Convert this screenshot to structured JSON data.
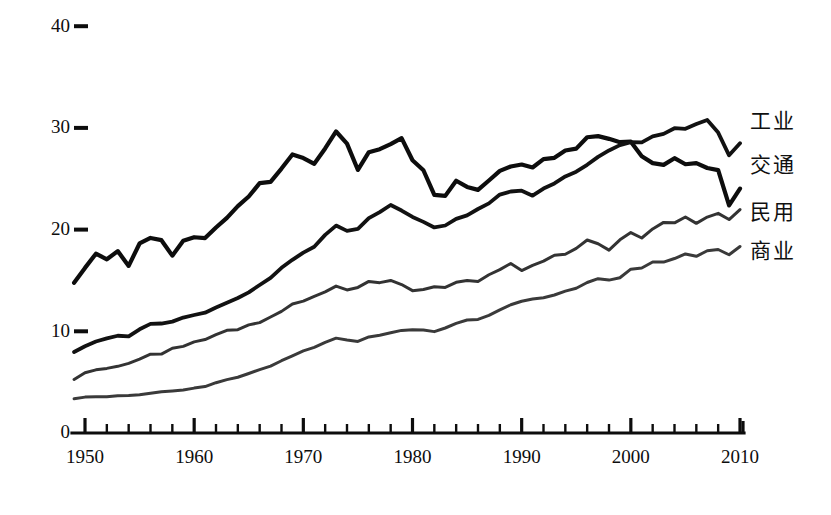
{
  "chart_data": {
    "type": "line",
    "title": "",
    "subtitle": "",
    "xlabel": "",
    "ylabel": "",
    "xlim": [
      1949,
      2010
    ],
    "ylim": [
      0,
      40
    ],
    "grid": false,
    "legend_position": "right-inline",
    "y_ticks": [
      0,
      10,
      20,
      30,
      40
    ],
    "y_tick_labels": [
      "0",
      "10",
      "20",
      "30",
      "40"
    ],
    "x_ticks": [
      1950,
      1960,
      1970,
      1980,
      1990,
      2000,
      2010
    ],
    "x_tick_labels": [
      "1950",
      "1960",
      "1970",
      "1980",
      "1990",
      "2000",
      "2010"
    ],
    "x_minor_tick_step": 2,
    "x": [
      1949,
      1950,
      1951,
      1952,
      1953,
      1954,
      1955,
      1956,
      1957,
      1958,
      1959,
      1960,
      1961,
      1962,
      1963,
      1964,
      1965,
      1966,
      1967,
      1968,
      1969,
      1970,
      1971,
      1972,
      1973,
      1974,
      1975,
      1976,
      1977,
      1978,
      1979,
      1980,
      1981,
      1982,
      1983,
      1984,
      1985,
      1986,
      1987,
      1988,
      1989,
      1990,
      1991,
      1992,
      1993,
      1994,
      1995,
      1996,
      1997,
      1998,
      1999,
      2000,
      2001,
      2002,
      2003,
      2004,
      2005,
      2006,
      2007,
      2008,
      2009,
      2010
    ],
    "series": [
      {
        "name": "工业",
        "color": "#0d0d0d",
        "width": 4.2,
        "label_x": 2011,
        "label_y": 30.5,
        "values": [
          14.8,
          16.2,
          17.6,
          17.1,
          17.9,
          16.4,
          18.6,
          19.2,
          19.0,
          17.4,
          18.9,
          19.3,
          19.2,
          20.2,
          21.2,
          22.3,
          23.3,
          24.6,
          24.7,
          26.0,
          27.4,
          27.0,
          26.5,
          28.0,
          29.6,
          28.5,
          25.9,
          27.6,
          27.9,
          28.4,
          29.0,
          26.8,
          25.8,
          23.4,
          23.3,
          24.8,
          24.2,
          23.9,
          24.8,
          25.8,
          26.2,
          26.4,
          26.1,
          26.9,
          27.1,
          27.8,
          28.0,
          29.1,
          29.2,
          28.9,
          28.6,
          28.6,
          27.2,
          26.5,
          26.4,
          27.0,
          26.4,
          26.5,
          26.1,
          25.8,
          22.4,
          24.0
        ]
      },
      {
        "name": "交通",
        "color": "#121212",
        "width": 3.8,
        "label_x": 2011,
        "label_y": 26.2,
        "values": [
          8.0,
          8.5,
          9.0,
          9.3,
          9.6,
          9.5,
          10.2,
          10.7,
          10.8,
          10.9,
          11.4,
          11.6,
          11.8,
          12.3,
          12.8,
          13.3,
          13.8,
          14.6,
          15.3,
          16.2,
          17.0,
          17.7,
          18.3,
          19.5,
          20.4,
          19.9,
          20.1,
          21.1,
          21.7,
          22.4,
          21.9,
          21.2,
          20.8,
          20.2,
          20.4,
          21.1,
          21.4,
          22.0,
          22.6,
          23.4,
          23.7,
          23.8,
          23.3,
          24.0,
          24.5,
          25.2,
          25.7,
          26.4,
          27.1,
          27.8,
          28.3,
          28.6,
          28.6,
          29.2,
          29.4,
          30.0,
          29.9,
          30.4,
          30.8,
          29.5,
          27.3,
          28.5
        ]
      },
      {
        "name": "民用",
        "color": "#333333",
        "width": 3.0,
        "label_x": 2011,
        "label_y": 21.6,
        "values": [
          5.3,
          5.9,
          6.2,
          6.4,
          6.6,
          6.8,
          7.3,
          7.7,
          7.8,
          8.3,
          8.5,
          9.0,
          9.2,
          9.7,
          10.1,
          10.2,
          10.6,
          10.9,
          11.4,
          12.0,
          12.7,
          13.0,
          13.4,
          13.9,
          14.4,
          14.1,
          14.3,
          14.9,
          14.8,
          15.0,
          14.6,
          14.0,
          14.1,
          14.4,
          14.3,
          14.8,
          15.0,
          14.9,
          15.6,
          16.1,
          16.7,
          16.0,
          16.5,
          16.9,
          17.5,
          17.6,
          18.2,
          19.0,
          18.6,
          18.0,
          19.0,
          19.7,
          19.2,
          20.1,
          20.7,
          20.7,
          21.2,
          20.6,
          21.2,
          21.6,
          21.0,
          22.0
        ]
      },
      {
        "name": "商业",
        "color": "#3a3a3a",
        "width": 3.0,
        "label_x": 2011,
        "label_y": 17.8,
        "values": [
          3.4,
          3.5,
          3.6,
          3.6,
          3.7,
          3.7,
          3.8,
          3.9,
          4.0,
          4.1,
          4.2,
          4.4,
          4.6,
          4.9,
          5.2,
          5.5,
          5.8,
          6.2,
          6.6,
          7.1,
          7.6,
          8.1,
          8.4,
          8.9,
          9.3,
          9.1,
          9.0,
          9.4,
          9.6,
          9.9,
          10.1,
          10.2,
          10.1,
          10.0,
          10.3,
          10.8,
          11.1,
          11.2,
          11.6,
          12.1,
          12.6,
          13.0,
          13.2,
          13.3,
          13.6,
          13.9,
          14.2,
          14.8,
          15.2,
          15.0,
          15.3,
          16.1,
          16.2,
          16.8,
          16.8,
          17.2,
          17.6,
          17.4,
          17.9,
          18.0,
          17.5,
          18.3
        ]
      }
    ]
  }
}
